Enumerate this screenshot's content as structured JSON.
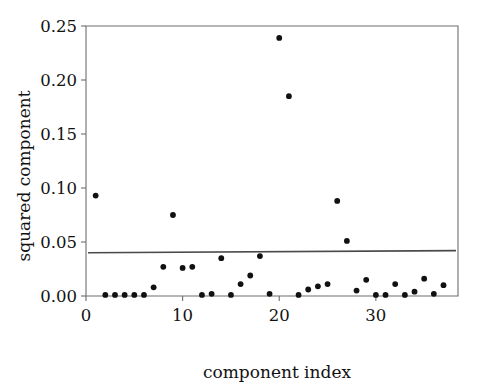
{
  "chart_data": {
    "type": "scatter",
    "title": "",
    "xlabel": "component index",
    "ylabel": "squared component",
    "xlim": [
      0,
      38.5
    ],
    "ylim": [
      0,
      0.25
    ],
    "grid": false,
    "legend": null,
    "x_ticks": [
      0,
      10,
      20,
      30
    ],
    "x_tick_labels": [
      "0",
      "10",
      "20",
      "30"
    ],
    "y_ticks": [
      0.0,
      0.05,
      0.1,
      0.15,
      0.2,
      0.25
    ],
    "y_tick_labels": [
      "0.00",
      "0.05",
      "0.10",
      "0.15",
      "0.20",
      "0.25"
    ],
    "marker": "filled-circle",
    "marker_color": "#111111",
    "x": [
      1,
      2,
      3,
      4,
      5,
      6,
      7,
      8,
      9,
      10,
      11,
      12,
      13,
      14,
      15,
      16,
      17,
      18,
      19,
      20,
      21,
      22,
      23,
      24,
      25,
      26,
      27,
      28,
      29,
      30,
      31,
      32,
      33,
      34,
      35,
      36,
      37
    ],
    "values": [
      0.093,
      0.001,
      0.001,
      0.001,
      0.001,
      0.001,
      0.008,
      0.027,
      0.075,
      0.026,
      0.027,
      0.001,
      0.002,
      0.035,
      0.001,
      0.011,
      0.019,
      0.037,
      0.002,
      0.239,
      0.185,
      0.001,
      0.006,
      0.009,
      0.011,
      0.088,
      0.051,
      0.005,
      0.015,
      0.001,
      0.001,
      0.011,
      0.001,
      0.004,
      0.016,
      0.002,
      0.01
    ],
    "series": [
      {
        "name": "squared component",
        "values": [
          0.093,
          0.001,
          0.001,
          0.001,
          0.001,
          0.001,
          0.008,
          0.027,
          0.075,
          0.026,
          0.027,
          0.001,
          0.002,
          0.035,
          0.001,
          0.011,
          0.019,
          0.037,
          0.002,
          0.239,
          0.185,
          0.001,
          0.006,
          0.009,
          0.011,
          0.088,
          0.051,
          0.005,
          0.015,
          0.001,
          0.001,
          0.011,
          0.001,
          0.004,
          0.016,
          0.002,
          0.01
        ]
      }
    ],
    "annotations": [
      {
        "name": "threshold-line",
        "type": "hline",
        "y_start": 0.04,
        "y_end": 0.042,
        "color": "#4a4a4a"
      }
    ]
  },
  "axes": {
    "x_title": "component index",
    "y_title": "squared component"
  }
}
